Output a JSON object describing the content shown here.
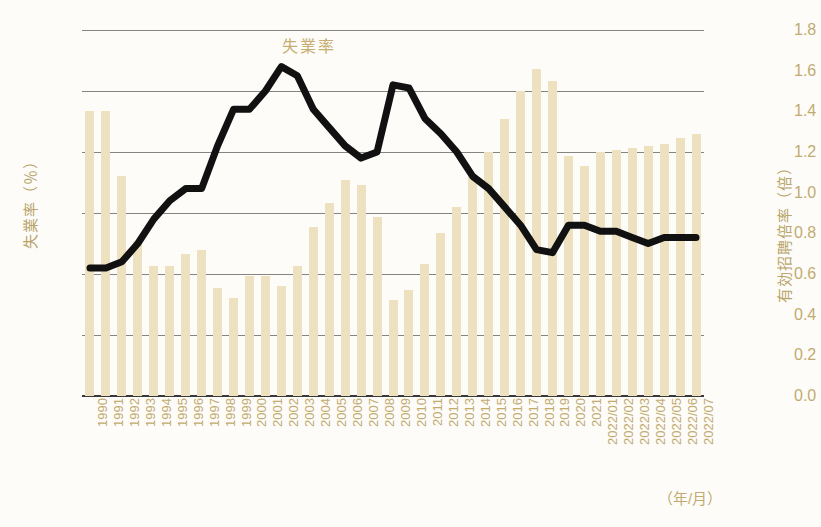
{
  "chart_data": {
    "type": "bar",
    "title": "失業率",
    "xlabel": "（年/月）",
    "ylabel": "失業率（％）",
    "y2label": "有効招聘倍率（倍）",
    "grid": true,
    "legend": "none",
    "ylim": [
      0.0,
      6.0
    ],
    "y2lim": [
      0.0,
      1.8
    ],
    "yticks": [
      "0.0",
      "1.0",
      "2.0",
      "3.0",
      "4.0",
      "5.0",
      "6.0"
    ],
    "y2ticks": [
      "0.0",
      "0.2",
      "0.4",
      "0.6",
      "0.8",
      "1.0",
      "1.2",
      "1.4",
      "1.6",
      "1.8"
    ],
    "categories": [
      "1990",
      "1991",
      "1992",
      "1993",
      "1994",
      "1995",
      "1996",
      "1997",
      "1998",
      "1999",
      "2000",
      "2001",
      "2002",
      "2003",
      "2004",
      "2005",
      "2006",
      "2007",
      "2008",
      "2009",
      "2010",
      "2011",
      "2012",
      "2013",
      "2014",
      "2015",
      "2016",
      "2017",
      "2018",
      "2019",
      "2020",
      "2021",
      "2022/01",
      "2022/02",
      "2022/03",
      "2022/04",
      "2022/05",
      "2022/06",
      "2022/07"
    ],
    "series": [
      {
        "name": "有効招聘倍率（倍）",
        "type": "bar",
        "axis": "right",
        "color": "#eee1c0",
        "values": [
          1.4,
          1.4,
          1.08,
          0.76,
          0.64,
          0.64,
          0.7,
          0.72,
          0.53,
          0.48,
          0.59,
          0.59,
          0.54,
          0.64,
          0.83,
          0.95,
          1.06,
          1.04,
          0.88,
          0.47,
          0.52,
          0.65,
          0.8,
          0.93,
          1.09,
          1.2,
          1.36,
          1.5,
          1.61,
          1.55,
          1.18,
          1.13,
          1.2,
          1.21,
          1.22,
          1.23,
          1.24,
          1.27,
          1.29
        ]
      },
      {
        "name": "失業率（％）",
        "type": "line",
        "axis": "left",
        "color": "#111111",
        "values": [
          2.1,
          2.1,
          2.2,
          2.5,
          2.9,
          3.2,
          3.4,
          3.4,
          4.1,
          4.7,
          4.7,
          5.0,
          5.4,
          5.25,
          4.7,
          4.4,
          4.1,
          3.9,
          4.0,
          5.1,
          5.05,
          4.55,
          4.3,
          4.0,
          3.6,
          3.4,
          3.1,
          2.8,
          2.4,
          2.35,
          2.8,
          2.8,
          2.7,
          2.7,
          2.6,
          2.5,
          2.6,
          2.6,
          2.6
        ]
      }
    ]
  }
}
